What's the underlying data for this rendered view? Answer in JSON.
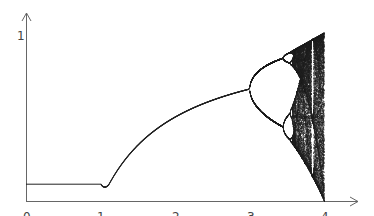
{
  "chart_data": {
    "type": "scatter",
    "title": "",
    "subtitle": "Logistic map bifurcation diagram",
    "xlabel": "",
    "ylabel": "",
    "xlim": [
      0,
      4.4
    ],
    "ylim": [
      0,
      1.05
    ],
    "x_ticks": [
      "0",
      "1",
      "2",
      "3",
      "4"
    ],
    "y_ticks": [
      "1"
    ],
    "grid": false,
    "legend": null,
    "series": [
      {
        "name": "fixed-point-zero",
        "x": [
          0,
          1
        ],
        "y": [
          0.1,
          0.1
        ]
      },
      {
        "name": "stable-branch",
        "x_range": [
          1,
          3
        ],
        "formula": "1 - 1/r"
      },
      {
        "name": "period-doubling-and-chaos",
        "x_range": [
          3,
          4
        ],
        "formula": "x -> r*x*(1-x)"
      }
    ],
    "annotations": []
  },
  "axes": {
    "x_tick_labels": [
      "0",
      "1",
      "2",
      "3",
      "4"
    ],
    "y_tick_label": "1"
  },
  "colors": {
    "axis": "#666666",
    "curve": "#222222",
    "background": "#ffffff"
  }
}
